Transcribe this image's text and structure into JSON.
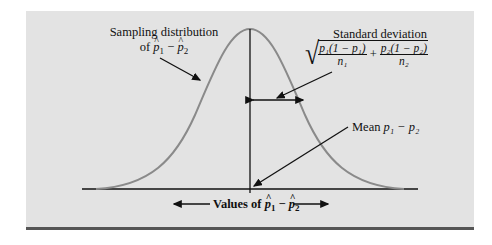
{
  "figure": {
    "type": "normal-distribution-diagram",
    "curve_color": "#8a8a8a",
    "panel_color": "#e3e3e3",
    "labels": {
      "sampling_distribution_line1": "Sampling distribution",
      "sampling_distribution_line2_prefix": "of ",
      "standard_deviation_title": "Standard deviation",
      "sd_frac1_num": "p₁(1 − p₁)",
      "sd_frac1_den": "n₁",
      "sd_plus": "+",
      "sd_frac2_num": "p₂(1 − p₂)",
      "sd_frac2_den": "n₂",
      "mean_prefix": "Mean ",
      "mean_expr": "p₁ − p₂",
      "axis_label_prefix": "Values of ",
      "p1": "p",
      "p1_sub": "1",
      "minus": " − ",
      "p2": "p",
      "p2_sub": "2"
    }
  }
}
